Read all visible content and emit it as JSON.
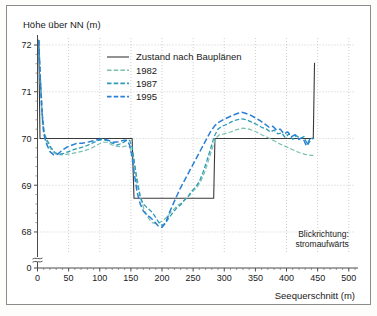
{
  "figure": {
    "background_color": "#ffffff",
    "frame_color": "#8c8c8c"
  },
  "chart_data": {
    "type": "line",
    "title": "",
    "xlabel": "Seequerschnitt (m)",
    "ylabel": "Höhe über NN (m)",
    "xlim": [
      0,
      510
    ],
    "ylim": [
      67.55,
      72.15
    ],
    "y_axis_break": true,
    "y_break_label": "0",
    "grid": "dotted-major-both",
    "legend_position": "upper-center-inside",
    "annotations": [
      {
        "text_line1": "Blickrichtung:",
        "text_line2": "stromaufwärts",
        "x": 500,
        "y": 67.9,
        "align": "right"
      }
    ],
    "xticks": [
      0,
      50,
      100,
      150,
      200,
      250,
      300,
      350,
      400,
      450,
      500
    ],
    "xtick_labels": [
      "0",
      "50",
      "100",
      "150",
      "200",
      "250",
      "300",
      "350",
      "400",
      "450",
      "500"
    ],
    "x_minor_tick_step": 10,
    "yticks": [
      68,
      69,
      70,
      71,
      72
    ],
    "ytick_labels": [
      "68",
      "69",
      "70",
      "71",
      "72"
    ],
    "y_minor_tick_step": 0.2,
    "series": [
      {
        "name": "Zustand nach Bauplänen",
        "color": "#3a3a3a",
        "style": "solid",
        "width": 1.1,
        "points": [
          [
            0,
            72.1
          ],
          [
            2,
            72.1
          ],
          [
            4,
            70.0
          ],
          [
            18,
            70.0
          ],
          [
            152,
            70.0
          ],
          [
            155,
            68.72
          ],
          [
            283,
            68.72
          ],
          [
            285,
            70.0
          ],
          [
            443,
            70.0
          ],
          [
            445,
            71.62
          ]
        ]
      },
      {
        "name": "1982",
        "color": "#79c0ae",
        "style": "dashed",
        "width": 1.2,
        "points": [
          [
            2,
            72.1
          ],
          [
            5,
            71.0
          ],
          [
            8,
            70.3
          ],
          [
            12,
            70.0
          ],
          [
            18,
            69.85
          ],
          [
            24,
            69.72
          ],
          [
            30,
            69.66
          ],
          [
            38,
            69.65
          ],
          [
            46,
            69.66
          ],
          [
            56,
            69.68
          ],
          [
            66,
            69.71
          ],
          [
            76,
            69.74
          ],
          [
            86,
            69.79
          ],
          [
            96,
            69.86
          ],
          [
            104,
            69.92
          ],
          [
            112,
            69.92
          ],
          [
            120,
            69.86
          ],
          [
            128,
            69.83
          ],
          [
            136,
            69.82
          ],
          [
            142,
            69.84
          ],
          [
            148,
            69.82
          ],
          [
            154,
            69.6
          ],
          [
            160,
            69.15
          ],
          [
            166,
            68.7
          ],
          [
            172,
            68.45
          ],
          [
            178,
            68.3
          ],
          [
            184,
            68.2
          ],
          [
            190,
            68.18
          ],
          [
            196,
            68.2
          ],
          [
            202,
            68.25
          ],
          [
            208,
            68.32
          ],
          [
            214,
            68.42
          ],
          [
            220,
            68.5
          ],
          [
            226,
            68.58
          ],
          [
            232,
            68.62
          ],
          [
            238,
            68.72
          ],
          [
            244,
            68.78
          ],
          [
            250,
            68.88
          ],
          [
            256,
            68.95
          ],
          [
            262,
            69.08
          ],
          [
            268,
            69.26
          ],
          [
            274,
            69.5
          ],
          [
            280,
            69.76
          ],
          [
            286,
            70.0
          ],
          [
            292,
            70.08
          ],
          [
            300,
            70.1
          ],
          [
            310,
            70.14
          ],
          [
            320,
            70.19
          ],
          [
            330,
            70.22
          ],
          [
            340,
            70.2
          ],
          [
            350,
            70.15
          ],
          [
            360,
            70.08
          ],
          [
            370,
            70.02
          ],
          [
            380,
            69.95
          ],
          [
            390,
            69.88
          ],
          [
            400,
            69.82
          ],
          [
            410,
            69.76
          ],
          [
            420,
            69.7
          ],
          [
            430,
            69.66
          ],
          [
            438,
            69.64
          ],
          [
            443,
            69.64
          ]
        ]
      },
      {
        "name": "1987",
        "color": "#2e9bb5",
        "style": "dashed",
        "width": 1.3,
        "points": [
          [
            2,
            72.1
          ],
          [
            5,
            71.2
          ],
          [
            8,
            70.5
          ],
          [
            11,
            70.1
          ],
          [
            16,
            69.95
          ],
          [
            22,
            69.8
          ],
          [
            28,
            69.7
          ],
          [
            34,
            69.66
          ],
          [
            42,
            69.68
          ],
          [
            50,
            69.72
          ],
          [
            58,
            69.76
          ],
          [
            68,
            69.8
          ],
          [
            78,
            69.84
          ],
          [
            88,
            69.9
          ],
          [
            96,
            69.95
          ],
          [
            104,
            69.98
          ],
          [
            112,
            69.96
          ],
          [
            120,
            69.9
          ],
          [
            128,
            69.86
          ],
          [
            136,
            69.9
          ],
          [
            142,
            69.95
          ],
          [
            148,
            69.96
          ],
          [
            152,
            69.82
          ],
          [
            156,
            69.45
          ],
          [
            160,
            69.05
          ],
          [
            165,
            68.75
          ],
          [
            170,
            68.6
          ],
          [
            176,
            68.52
          ],
          [
            182,
            68.45
          ],
          [
            188,
            68.35
          ],
          [
            194,
            68.22
          ],
          [
            200,
            68.14
          ],
          [
            206,
            68.2
          ],
          [
            212,
            68.32
          ],
          [
            218,
            68.42
          ],
          [
            224,
            68.52
          ],
          [
            230,
            68.58
          ],
          [
            236,
            68.68
          ],
          [
            242,
            68.76
          ],
          [
            248,
            68.88
          ],
          [
            254,
            68.96
          ],
          [
            260,
            69.08
          ],
          [
            266,
            69.28
          ],
          [
            272,
            69.52
          ],
          [
            278,
            69.78
          ],
          [
            284,
            70.05
          ],
          [
            290,
            70.2
          ],
          [
            296,
            70.26
          ],
          [
            304,
            70.3
          ],
          [
            312,
            70.36
          ],
          [
            320,
            70.4
          ],
          [
            328,
            70.42
          ],
          [
            336,
            70.4
          ],
          [
            344,
            70.35
          ],
          [
            352,
            70.3
          ],
          [
            360,
            70.24
          ],
          [
            368,
            70.2
          ],
          [
            374,
            70.14
          ],
          [
            380,
            70.18
          ],
          [
            386,
            70.1
          ],
          [
            392,
            70.12
          ],
          [
            398,
            70.02
          ],
          [
            404,
            70.1
          ],
          [
            410,
            69.98
          ],
          [
            416,
            70.06
          ],
          [
            422,
            70.0
          ],
          [
            428,
            70.04
          ],
          [
            434,
            69.86
          ],
          [
            440,
            70.0
          ],
          [
            443,
            70.0
          ]
        ]
      },
      {
        "name": "1995",
        "color": "#2b7fd4",
        "style": "dashed",
        "width": 1.5,
        "points": [
          [
            2,
            72.1
          ],
          [
            4,
            71.4
          ],
          [
            7,
            70.6
          ],
          [
            10,
            70.1
          ],
          [
            14,
            69.9
          ],
          [
            20,
            69.72
          ],
          [
            26,
            69.65
          ],
          [
            32,
            69.66
          ],
          [
            40,
            69.75
          ],
          [
            48,
            69.82
          ],
          [
            56,
            69.86
          ],
          [
            64,
            69.9
          ],
          [
            72,
            69.9
          ],
          [
            80,
            69.92
          ],
          [
            90,
            69.95
          ],
          [
            98,
            69.98
          ],
          [
            106,
            69.99
          ],
          [
            114,
            69.96
          ],
          [
            122,
            69.92
          ],
          [
            130,
            69.93
          ],
          [
            138,
            69.96
          ],
          [
            144,
            69.96
          ],
          [
            148,
            69.86
          ],
          [
            152,
            69.6
          ],
          [
            156,
            69.2
          ],
          [
            160,
            68.85
          ],
          [
            165,
            68.6
          ],
          [
            170,
            68.45
          ],
          [
            176,
            68.36
          ],
          [
            182,
            68.3
          ],
          [
            188,
            68.22
          ],
          [
            194,
            68.13
          ],
          [
            200,
            68.1
          ],
          [
            206,
            68.2
          ],
          [
            212,
            68.42
          ],
          [
            218,
            68.6
          ],
          [
            224,
            68.78
          ],
          [
            230,
            68.95
          ],
          [
            236,
            69.1
          ],
          [
            242,
            69.25
          ],
          [
            248,
            69.4
          ],
          [
            254,
            69.55
          ],
          [
            260,
            69.7
          ],
          [
            266,
            69.85
          ],
          [
            272,
            70.0
          ],
          [
            278,
            70.15
          ],
          [
            284,
            70.26
          ],
          [
            290,
            70.34
          ],
          [
            298,
            70.4
          ],
          [
            306,
            70.45
          ],
          [
            314,
            70.5
          ],
          [
            322,
            70.54
          ],
          [
            328,
            70.56
          ],
          [
            334,
            70.54
          ],
          [
            342,
            70.5
          ],
          [
            350,
            70.44
          ],
          [
            358,
            70.38
          ],
          [
            366,
            70.3
          ],
          [
            372,
            70.24
          ],
          [
            378,
            70.26
          ],
          [
            384,
            70.18
          ],
          [
            390,
            70.2
          ],
          [
            396,
            70.1
          ],
          [
            402,
            70.14
          ],
          [
            408,
            70.04
          ],
          [
            414,
            70.08
          ],
          [
            420,
            69.98
          ],
          [
            426,
            70.02
          ],
          [
            432,
            69.84
          ],
          [
            438,
            70.0
          ],
          [
            443,
            70.0
          ]
        ]
      }
    ],
    "legend_entries": [
      {
        "label": "Zustand nach Bauplänen",
        "color": "#3a3a3a",
        "style": "solid"
      },
      {
        "label": "1982",
        "color": "#79c0ae",
        "style": "dashed"
      },
      {
        "label": "1987",
        "color": "#2e9bb5",
        "style": "dashed"
      },
      {
        "label": "1995",
        "color": "#2b7fd4",
        "style": "dashed"
      }
    ]
  }
}
